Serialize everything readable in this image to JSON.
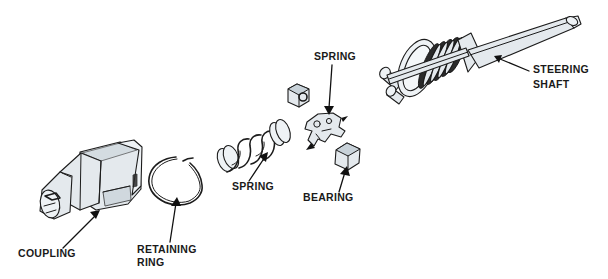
{
  "diagram": {
    "background_color": "#ffffff",
    "line_color": "#1c1c1c",
    "part_fill_color": "#e4e9ed",
    "label_color": "#1a1a1a",
    "labels": [
      {
        "id": "coupling",
        "text": "COUPLING",
        "text_line2": "",
        "x": 18,
        "y": 257,
        "points_to": "coupling-body"
      },
      {
        "id": "retaining-ring",
        "text": "RETAINING",
        "text_line2": "RING",
        "x": 137,
        "y": 253,
        "points_to": "retaining-ring-part"
      },
      {
        "id": "spring-lower",
        "text": "SPRING",
        "text_line2": "",
        "x": 232,
        "y": 190,
        "points_to": "coil-spring"
      },
      {
        "id": "spring-upper",
        "text": "SPRING",
        "text_line2": "",
        "x": 314,
        "y": 60,
        "points_to": "spring-clip"
      },
      {
        "id": "bearing",
        "text": "BEARING",
        "text_line2": "",
        "x": 303,
        "y": 201,
        "points_to": "bearing-cube-lower"
      },
      {
        "id": "steering-shaft",
        "text": "STEERING",
        "text_line2": "SHAFT",
        "x": 533,
        "y": 73,
        "points_to": "steering-shaft-part"
      }
    ],
    "parts": [
      {
        "id": "coupling-body",
        "name": "coupling",
        "description": "stepped cylindrical coupling with slotted neck"
      },
      {
        "id": "retaining-ring-part",
        "name": "retaining ring",
        "description": "open C-shaped snap ring"
      },
      {
        "id": "coil-spring",
        "name": "spring",
        "description": "helical compression coil spring"
      },
      {
        "id": "spring-clip",
        "name": "spring",
        "description": "small stamped spring clip"
      },
      {
        "id": "bearing-cube-upper",
        "name": "bearing",
        "description": "small cubic bearing block"
      },
      {
        "id": "bearing-cube-lower",
        "name": "bearing",
        "description": "small cubic bearing block"
      },
      {
        "id": "steering-shaft-part",
        "name": "steering shaft",
        "description": "tapered shaft with ribbed bellows and cross-pin yoke ring"
      }
    ]
  }
}
